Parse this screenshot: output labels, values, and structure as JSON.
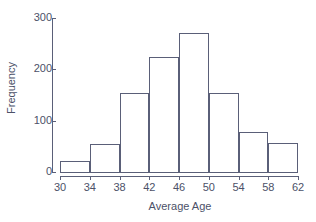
{
  "chart_data": {
    "type": "bar",
    "title": "",
    "xlabel": "Average Age",
    "ylabel": "Frequency",
    "bin_edges": [
      30,
      34,
      38,
      42,
      46,
      50,
      54,
      58,
      62
    ],
    "categories": [
      "30-34",
      "34-38",
      "38-42",
      "42-46",
      "46-50",
      "50-54",
      "54-58",
      "58-62"
    ],
    "values": [
      21,
      55,
      153,
      225,
      270,
      153,
      78,
      57
    ],
    "bin_width": 4,
    "xlim": [
      30,
      62
    ],
    "ylim": [
      0,
      300
    ],
    "xticks": [
      30,
      34,
      38,
      42,
      46,
      50,
      54,
      58,
      62
    ],
    "xtick_labels": [
      "30",
      "34",
      "38",
      "42",
      "46",
      "50",
      "54",
      "58",
      "62"
    ],
    "yticks": [
      0,
      100,
      200,
      300
    ],
    "ytick_labels": [
      "0",
      "100",
      "200",
      "300"
    ],
    "grid": false,
    "legend": null,
    "bar_fill": "#ffffff",
    "bar_stroke": "#5a5f78",
    "axis_color": "#5a5f78",
    "text_color": "#4c5168",
    "background": "#ffffff"
  }
}
